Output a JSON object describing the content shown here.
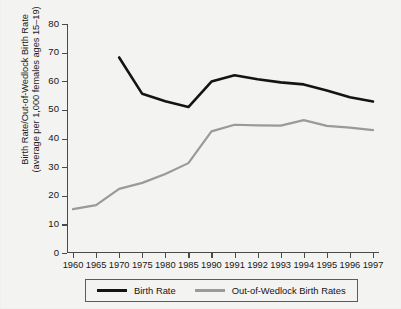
{
  "chart_data": {
    "type": "line",
    "title": "",
    "subtitle": "",
    "xlabel": "",
    "ylabel": "Birth Rate/Out-of-Wedlock Birth Rate\n(average per 1,000 females ages 15–19)",
    "categories": [
      "1960",
      "1965",
      "1970",
      "1975",
      "1980",
      "1985",
      "1990",
      "1991",
      "1992",
      "1993",
      "1994",
      "1995",
      "1996",
      "1997"
    ],
    "ylim": [
      0,
      80
    ],
    "yticks": [
      0,
      10,
      20,
      30,
      40,
      50,
      60,
      70,
      80
    ],
    "grid": false,
    "legend_position": "bottom",
    "series": [
      {
        "name": "Birth Rate",
        "color": "#141414",
        "x": [
          "1970",
          "1975",
          "1980",
          "1985",
          "1990",
          "1991",
          "1992",
          "1993",
          "1994",
          "1995",
          "1996",
          "1997"
        ],
        "values": [
          68.3,
          55.6,
          53.0,
          51.0,
          59.9,
          62.1,
          60.7,
          59.6,
          58.9,
          56.8,
          54.4,
          52.9
        ]
      },
      {
        "name": "Out-of-Wedlock Birth Rates",
        "color": "#9a9a9a",
        "x": [
          "1960",
          "1965",
          "1970",
          "1975",
          "1980",
          "1985",
          "1990",
          "1991",
          "1992",
          "1993",
          "1994",
          "1995",
          "1996",
          "1997"
        ],
        "values": [
          15.3,
          16.7,
          22.4,
          24.5,
          27.6,
          31.4,
          42.5,
          44.8,
          44.6,
          44.5,
          46.4,
          44.4,
          43.8,
          42.9
        ]
      }
    ]
  },
  "legend": {
    "items": [
      {
        "label": "Birth Rate",
        "color": "#141414"
      },
      {
        "label": "Out-of-Wedlock Birth Rates",
        "color": "#9a9a9a"
      }
    ]
  }
}
